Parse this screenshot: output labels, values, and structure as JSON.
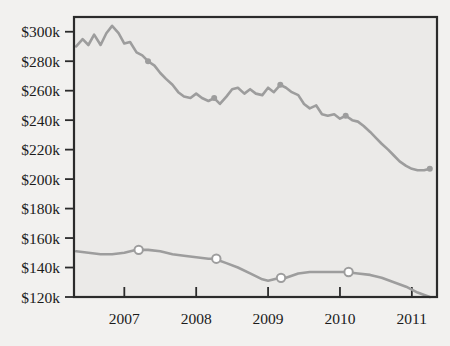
{
  "chart_data": {
    "type": "line",
    "title": "",
    "subtitle": "",
    "xlabel": "",
    "ylabel": "",
    "xlim": [
      2006.3,
      2011.35
    ],
    "ylim": [
      120000,
      310000
    ],
    "grid": false,
    "legend": "none",
    "y_ticks": [
      120000,
      140000,
      160000,
      180000,
      200000,
      220000,
      240000,
      260000,
      280000,
      300000
    ],
    "y_tick_labels": [
      "$120k",
      "$140k",
      "$160k",
      "$180k",
      "$200k",
      "$220k",
      "$240k",
      "$260k",
      "$280k",
      "$300k"
    ],
    "x_ticks": [
      2007,
      2008,
      2009,
      2010,
      2011
    ],
    "x_tick_labels": [
      "2007",
      "2008",
      "2009",
      "2010",
      "2011"
    ],
    "series": [
      {
        "name": "upper-series",
        "color": "#9d9d9d",
        "marker": "filled-circle",
        "marker_color": "#9d9d9d",
        "x": [
          2006.33,
          2006.42,
          2006.5,
          2006.58,
          2006.67,
          2006.75,
          2006.83,
          2006.92,
          2007.0,
          2007.08,
          2007.17,
          2007.25,
          2007.33,
          2007.42,
          2007.5,
          2007.58,
          2007.67,
          2007.75,
          2007.83,
          2007.92,
          2008.0,
          2008.08,
          2008.17,
          2008.25,
          2008.33,
          2008.42,
          2008.5,
          2008.58,
          2008.67,
          2008.75,
          2008.83,
          2008.92,
          2009.0,
          2009.08,
          2009.17,
          2009.25,
          2009.33,
          2009.42,
          2009.5,
          2009.58,
          2009.67,
          2009.75,
          2009.83,
          2009.92,
          2010.0,
          2010.08,
          2010.17,
          2010.25,
          2010.33,
          2010.42,
          2010.5,
          2010.58,
          2010.67,
          2010.75,
          2010.83,
          2010.92,
          2011.0,
          2011.08,
          2011.17,
          2011.25
        ],
        "y": [
          290000,
          295000,
          291000,
          298000,
          291000,
          299000,
          304000,
          299000,
          292000,
          293000,
          286000,
          284000,
          280000,
          277000,
          272000,
          268000,
          264000,
          259000,
          256000,
          255000,
          258000,
          255000,
          253000,
          255000,
          251000,
          256000,
          261000,
          262000,
          258000,
          261000,
          258000,
          257000,
          262000,
          259000,
          264000,
          262000,
          259000,
          257000,
          251000,
          248000,
          250000,
          244000,
          243000,
          244000,
          241000,
          243000,
          240000,
          239000,
          236000,
          232000,
          228000,
          224000,
          220000,
          216000,
          212000,
          209000,
          207000,
          206000,
          206000,
          207000
        ],
        "markers": [
          {
            "x": 2007.33,
            "y": 280000
          },
          {
            "x": 2008.25,
            "y": 255000
          },
          {
            "x": 2009.17,
            "y": 264000
          },
          {
            "x": 2010.08,
            "y": 243000
          },
          {
            "x": 2011.25,
            "y": 207000
          }
        ]
      },
      {
        "name": "lower-series",
        "color": "#9d9d9d",
        "marker": "open-circle",
        "marker_color": "#ffffff",
        "x": [
          2006.33,
          2006.5,
          2006.67,
          2006.83,
          2007.0,
          2007.17,
          2007.33,
          2007.5,
          2007.67,
          2007.83,
          2008.0,
          2008.17,
          2008.25,
          2008.42,
          2008.58,
          2008.75,
          2008.92,
          2009.0,
          2009.17,
          2009.25,
          2009.42,
          2009.58,
          2009.75,
          2009.92,
          2010.08,
          2010.25,
          2010.42,
          2010.58,
          2010.75,
          2010.92,
          2011.08,
          2011.25
        ],
        "y": [
          151000,
          150000,
          149000,
          149000,
          150000,
          152000,
          152000,
          151000,
          149000,
          148000,
          147000,
          146000,
          146000,
          143000,
          140000,
          136000,
          132000,
          131000,
          133000,
          133000,
          136000,
          137000,
          137000,
          137000,
          137000,
          136000,
          135000,
          133000,
          130000,
          127000,
          123000,
          120000
        ],
        "markers": [
          {
            "x": 2007.2,
            "y": 152000
          },
          {
            "x": 2008.28,
            "y": 146000
          },
          {
            "x": 2009.18,
            "y": 133000
          },
          {
            "x": 2010.12,
            "y": 137000
          }
        ]
      }
    ],
    "colors": {
      "line": "#9d9d9d",
      "axis": "#2b2b2b",
      "plot_background": "#ebeae8",
      "page_background": "#f2f1ef",
      "text": "#1b1b1b"
    }
  }
}
